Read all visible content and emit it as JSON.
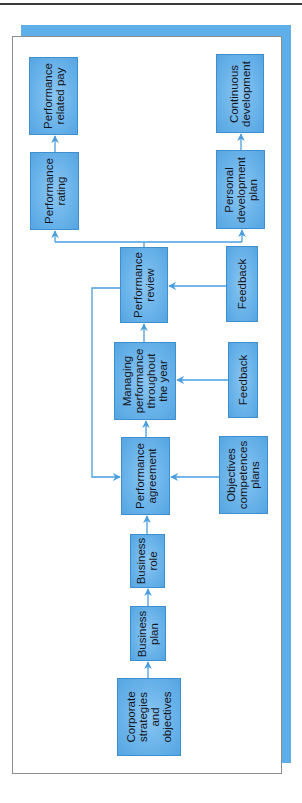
{
  "header": {
    "cut_text": "Performance Management"
  },
  "diagram": {
    "title": "",
    "colors": {
      "box_fill": "#6bb4ea",
      "box_border": "#3d8fcf",
      "connector": "#4a9ee0",
      "frame_shadow": "#5eaeea",
      "text": "#15161f"
    },
    "nodes": [
      {
        "id": "corporate",
        "label": "Corporate\nstrategies\nand\nobjectives"
      },
      {
        "id": "business_plan",
        "label": "Business\nplan"
      },
      {
        "id": "business_role",
        "label": "Business\nrole"
      },
      {
        "id": "agreement",
        "label": "Performance\nagreement"
      },
      {
        "id": "objectives",
        "label": "Objectives\ncompetences\nplans"
      },
      {
        "id": "managing",
        "label": "Managing\nperformance\nthroughout\nthe year"
      },
      {
        "id": "feedback_1",
        "label": "Feedback"
      },
      {
        "id": "review",
        "label": "Performance\nreview"
      },
      {
        "id": "feedback_2",
        "label": "Feedback"
      },
      {
        "id": "rating",
        "label": "Performance\nrating"
      },
      {
        "id": "pay",
        "label": "Performance\nrelated pay"
      },
      {
        "id": "pdp",
        "label": "Personal\ndevelopment\nplan"
      },
      {
        "id": "continuous",
        "label": "Continuous\ndevelopment"
      }
    ],
    "edges": [
      {
        "from": "corporate",
        "to": "business_plan"
      },
      {
        "from": "business_plan",
        "to": "business_role"
      },
      {
        "from": "business_role",
        "to": "agreement"
      },
      {
        "from": "objectives",
        "to": "agreement"
      },
      {
        "from": "agreement",
        "to": "managing"
      },
      {
        "from": "feedback_1",
        "to": "managing"
      },
      {
        "from": "managing",
        "to": "review"
      },
      {
        "from": "feedback_2",
        "to": "review"
      },
      {
        "from": "review",
        "to": "agreement",
        "note": "loop back"
      },
      {
        "from": "review",
        "to": "rating"
      },
      {
        "from": "review",
        "to": "pdp"
      },
      {
        "from": "rating",
        "to": "pay"
      },
      {
        "from": "pdp",
        "to": "continuous"
      }
    ]
  }
}
